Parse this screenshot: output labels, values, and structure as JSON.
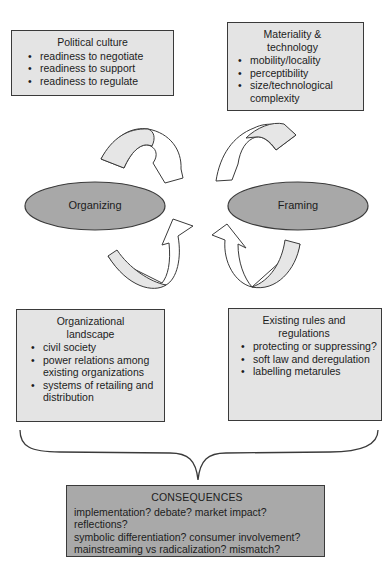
{
  "boxes": {
    "political": {
      "title": "Political culture",
      "items": [
        "readiness to negotiate",
        "readiness to support",
        "readiness to regulate"
      ]
    },
    "material": {
      "title_line1": "Materiality &",
      "title_line2": "technology",
      "items": [
        "mobility/locality",
        "perceptibility",
        "size/technological complexity"
      ]
    },
    "organizational": {
      "title_line1": "Organizational",
      "title_line2": "landscape",
      "items": [
        "civil society",
        "power relations among existing organizations",
        "systems of retailing and distribution"
      ]
    },
    "rules": {
      "title_line1": "Existing rules and",
      "title_line2": "regulations",
      "items": [
        "protecting or suppressing?",
        "soft law and deregulation",
        "labelling metarules"
      ]
    }
  },
  "ellipses": {
    "left": "Organizing",
    "right": "Framing"
  },
  "consequences": {
    "title": "CONSEQUENCES",
    "lines": [
      "implementation? debate? market impact? reflections?",
      "symbolic differentiation? consumer involvement?",
      "mainstreaming vs radicalization? mismatch?"
    ]
  },
  "colors": {
    "box_fill": "#e4e4e4",
    "ellipse_fill": "#a8a8a8",
    "consequences_fill": "#a9a9a9",
    "arrow_fill": "#e6e6e6",
    "stroke": "#3a3a3a"
  }
}
